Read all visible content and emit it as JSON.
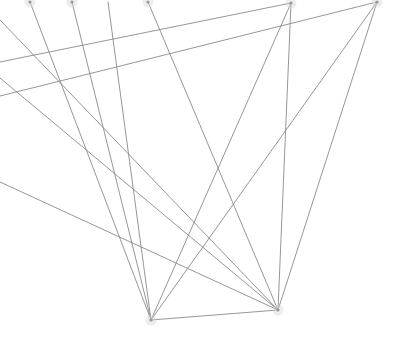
{
  "canvas": {
    "width": 419,
    "height": 356,
    "background_color": "#ffffff",
    "title": "Abstract line diagram"
  },
  "style": {
    "edge_color": "#8a8a8a",
    "edge_width": 0.9,
    "node_color": "#9a9a9a",
    "node_radius": 1.6,
    "node_halo_color": "#d8d8d8",
    "node_halo_radius": 5.5
  },
  "nodes": [
    {
      "id": "n1",
      "name": "top-node-a",
      "x": 30,
      "y": 2,
      "visible": true
    },
    {
      "id": "n2",
      "name": "top-node-b",
      "x": 72,
      "y": 2,
      "visible": true
    },
    {
      "id": "n3",
      "name": "top-node-c",
      "x": 148,
      "y": 2,
      "visible": true
    },
    {
      "id": "n4",
      "name": "top-node-d",
      "x": 291,
      "y": 3,
      "visible": true
    },
    {
      "id": "n5",
      "name": "top-node-e",
      "x": 377,
      "y": 2,
      "visible": true
    },
    {
      "id": "n6",
      "name": "left-edge-node-a",
      "x": 0,
      "y": 20,
      "visible": false
    },
    {
      "id": "n7",
      "name": "left-edge-node-b",
      "x": 0,
      "y": 62,
      "visible": false
    },
    {
      "id": "n8",
      "name": "left-edge-node-c",
      "x": 0,
      "y": 78,
      "visible": false
    },
    {
      "id": "n9",
      "name": "left-edge-node-d",
      "x": 0,
      "y": 96,
      "visible": false
    },
    {
      "id": "n10",
      "name": "left-edge-node-e",
      "x": 0,
      "y": 182,
      "visible": false
    },
    {
      "id": "n11",
      "name": "hub-node-left",
      "x": 151,
      "y": 320,
      "visible": true
    },
    {
      "id": "n12",
      "name": "hub-node-right",
      "x": 278,
      "y": 310,
      "visible": true
    },
    {
      "id": "n13",
      "name": "top-node-f",
      "x": 108,
      "y": 2,
      "visible": false
    }
  ],
  "edges": [
    {
      "id": "e1",
      "name": "edge-top-a-to-hub-left",
      "from": "n1",
      "to": "n11"
    },
    {
      "id": "e2",
      "name": "edge-top-b-to-hub-left",
      "from": "n2",
      "to": "n11"
    },
    {
      "id": "e3",
      "name": "edge-top-c-to-hub-right",
      "from": "n3",
      "to": "n12"
    },
    {
      "id": "e4",
      "name": "edge-top-d-to-hub-left",
      "from": "n4",
      "to": "n11"
    },
    {
      "id": "e5",
      "name": "edge-top-d-to-hub-right",
      "from": "n4",
      "to": "n12"
    },
    {
      "id": "e6",
      "name": "edge-top-e-to-hub-right",
      "from": "n5",
      "to": "n12"
    },
    {
      "id": "e7",
      "name": "edge-top-e-to-hub-left",
      "from": "n5",
      "to": "n11"
    },
    {
      "id": "e8",
      "name": "edge-left-a-to-hub-right",
      "from": "n6",
      "to": "n12"
    },
    {
      "id": "e9",
      "name": "edge-left-b-to-top-d",
      "from": "n7",
      "to": "n4"
    },
    {
      "id": "e10",
      "name": "edge-left-c-to-hub-right",
      "from": "n8",
      "to": "n12"
    },
    {
      "id": "e11",
      "name": "edge-left-d-to-top-e",
      "from": "n9",
      "to": "n5"
    },
    {
      "id": "e12",
      "name": "edge-left-e-to-hub-right",
      "from": "n10",
      "to": "n12"
    },
    {
      "id": "e13",
      "name": "edge-hub-left-to-hub-right",
      "from": "n11",
      "to": "n12"
    },
    {
      "id": "e14",
      "name": "edge-top-f-to-hub-left",
      "from": "n13",
      "to": "n11"
    }
  ],
  "summary": {
    "node_count": 13,
    "edge_count": 14,
    "hub_count": 2
  }
}
